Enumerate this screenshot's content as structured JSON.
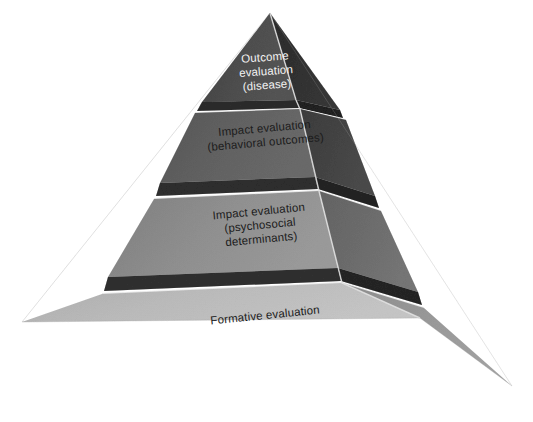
{
  "figure": {
    "shape": "triangular-pyramid",
    "tier_count": 4,
    "caption_fragment": ""
  },
  "tiers": [
    {
      "index": 1,
      "position": "top",
      "label": "Outcome\nevaluation\n(disease)",
      "lines": [
        "Outcome",
        "evaluation",
        "(disease)"
      ],
      "text_color": "#f2f2f2",
      "face_color": "#8c8c8c"
    },
    {
      "index": 2,
      "position": "upper-middle",
      "label": "Impact evaluation\n(behavioral outcomes)",
      "lines": [
        "Impact evaluation",
        "(behavioral outcomes)"
      ],
      "text_color": "#1c1c1c",
      "face_color": "#9c9c9c"
    },
    {
      "index": 3,
      "position": "lower-middle",
      "label": "Impact evaluation\n(psychosocial\ndeterminants)",
      "lines": [
        "Impact evaluation",
        "(psychosocial",
        "determinants)"
      ],
      "text_color": "#1c1c1c",
      "face_color": "#bdbdbd"
    },
    {
      "index": 4,
      "position": "base",
      "label": "Formative evaluation",
      "lines": [
        "Formative evaluation"
      ],
      "text_color": "#1c1c1c",
      "face_color": "#d7d7d7"
    }
  ],
  "colors": {
    "background": "#ffffff",
    "divider_band": "#6e6e6e",
    "divider_band_dark": "#666666",
    "edge_line": "#f5f5f5",
    "right_face_tier1": "#6f6f6f",
    "right_face_tier2": "#808080",
    "right_face_tier3": "#a3a3a3",
    "right_face_tier4": "#c2c2c2"
  },
  "geometry": {
    "apex": {
      "x": 270,
      "y": 13
    },
    "base_left": {
      "x": 22,
      "y": 322
    },
    "base_right": {
      "x": 512,
      "y": 386
    },
    "ridge_bottom": {
      "x": 420,
      "y": 318
    }
  }
}
